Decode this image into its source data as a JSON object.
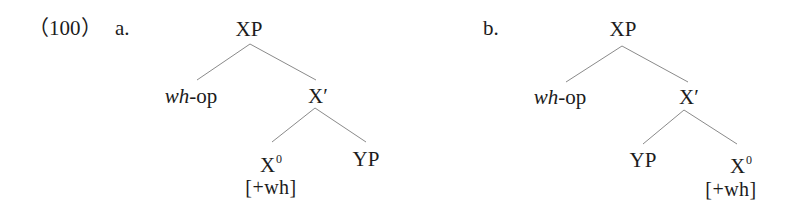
{
  "example": {
    "number_label": "（100）",
    "trees": [
      {
        "id": "a",
        "label": "a.",
        "root": "XP",
        "specifier": {
          "italic": "wh",
          "rest": "-op"
        },
        "bar": "X′",
        "children_order": [
          "X0",
          "YP"
        ],
        "head": {
          "base": "X",
          "sup": "0",
          "feature": "[+wh]"
        },
        "complement": "YP"
      },
      {
        "id": "b",
        "label": "b.",
        "root": "XP",
        "specifier": {
          "italic": "wh",
          "rest": "-op"
        },
        "bar": "X′",
        "children_order": [
          "YP",
          "X0"
        ],
        "head": {
          "base": "X",
          "sup": "0",
          "feature": "[+wh]"
        },
        "complement": "YP"
      }
    ]
  },
  "colors": {
    "text": "#1c1c1c",
    "edges": "#8a8a8a",
    "background": "#ffffff"
  }
}
